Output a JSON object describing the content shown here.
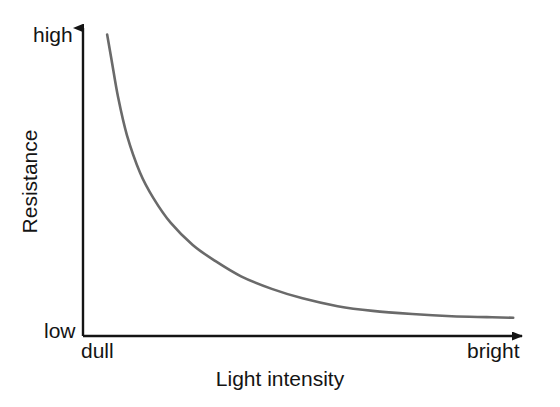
{
  "figure": {
    "kind": "line-chart-diagram",
    "background_color": "#ffffff",
    "axis_color": "#141414",
    "curve_color": "#6a6a6a"
  },
  "labels": {
    "y_axis_title": "Resistance",
    "x_axis_title": "Light intensity",
    "y_top_tick": "high",
    "y_bottom_tick": "low",
    "x_left_tick": "dull",
    "x_right_tick": "bright"
  },
  "chart_data": {
    "type": "line",
    "title": "",
    "subtitle": "",
    "xlabel": "Light intensity",
    "ylabel": "Resistance",
    "grid": false,
    "legend": null,
    "legend_position": "none",
    "x_tick_labels": [
      "dull",
      "bright"
    ],
    "y_tick_labels": [
      "low",
      "high"
    ],
    "xlim": [
      0,
      100
    ],
    "ylim": [
      0,
      100
    ],
    "axis_arrows": {
      "x_axis": "arrow-right",
      "y_axis": "arrow-up"
    },
    "relationship": "inverse",
    "annotation": "Resistance falls steeply as light intensity increases, then levels off approaching a low asymptote",
    "series": [
      {
        "name": "LDR resistance",
        "color": "#6a6a6a",
        "x": [
          5.5,
          6.5,
          8,
          10,
          13,
          16,
          20,
          25,
          30,
          36,
          43,
          50,
          58,
          66,
          75,
          84,
          92,
          98
        ],
        "y": [
          96,
          88,
          76,
          64,
          52,
          44,
          36,
          29,
          24,
          19,
          15,
          12,
          9.5,
          8,
          7,
          6.3,
          6,
          5.8
        ]
      }
    ]
  }
}
